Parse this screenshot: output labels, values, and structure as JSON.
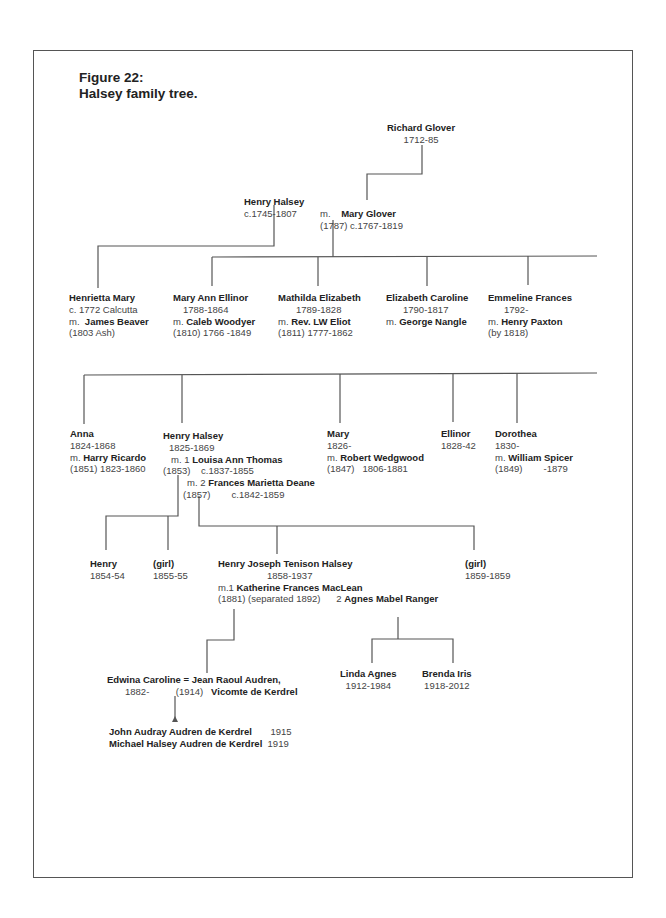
{
  "figure": {
    "label": "Figure 22:",
    "caption": "Halsey family tree."
  },
  "generation_1": {
    "richard_glover": {
      "name": "Richard Glover",
      "dates": "1712-85"
    },
    "henry_halsey": {
      "name": "Henry Halsey",
      "dates": "c.1745-1807"
    },
    "mary_glover": {
      "prefix": "m.",
      "name": "Mary Glover",
      "marriage": "(1787)",
      "dates": "c.1767-1819"
    }
  },
  "generation_2": [
    {
      "name": "Henrietta Mary",
      "line2": "c. 1772 Calcutta",
      "m_prefix": "m.",
      "spouse": "James Beaver",
      "line4": "(1803 Ash)"
    },
    {
      "name": "Mary Ann Ellinor",
      "line2": "1788-1864",
      "m_prefix": "m.",
      "spouse": "Caleb Woodyer",
      "line4": "(1810)  1766 -1849"
    },
    {
      "name": "Mathilda Elizabeth",
      "line2": "1789-1828",
      "m_prefix": "m.",
      "spouse": "Rev. LW Eliot",
      "line4": "(1811)  1777-1862"
    },
    {
      "name": "Elizabeth Caroline",
      "line2": "1790-1817",
      "m_prefix": "m.",
      "spouse": "George Nangle",
      "line4": ""
    },
    {
      "name": "Emmeline Frances",
      "line2": "1792-",
      "m_prefix": "m.",
      "spouse": "Henry Paxton",
      "line4": "(by 1818)"
    }
  ],
  "generation_3": {
    "anna": {
      "name": "Anna",
      "dates": "1824-1868",
      "m_prefix": "m.",
      "spouse": "Harry Ricardo",
      "marriage": "(1851) 1823-1860"
    },
    "henry_halsey": {
      "name": "Henry Halsey",
      "dates": "1825-1869",
      "m1_prefix": "m. 1",
      "spouse1": "Louisa Ann Thomas",
      "m1_marriage": "(1853)",
      "spouse1_dates": "c.1837-1855",
      "m2_prefix": "m. 2",
      "spouse2": "Frances Marietta Deane",
      "m2_marriage": "(1857)",
      "spouse2_dates": "c.1842-1859"
    },
    "mary": {
      "name": "Mary",
      "dates": "1826-",
      "m_prefix": "m.",
      "spouse": "Robert Wedgwood",
      "marriage": "(1847)   1806-1881"
    },
    "ellinor": {
      "name": "Ellinor",
      "dates": "1828-42"
    },
    "dorothea": {
      "name": "Dorothea",
      "dates": "1830-",
      "m_prefix": "m.",
      "spouse": "William Spicer",
      "marriage": "(1849)        -1879"
    }
  },
  "generation_4": {
    "henry": {
      "name": "Henry",
      "dates": "1854-54"
    },
    "girl_1": {
      "name": "(girl)",
      "dates": "1855-55"
    },
    "henry_joseph": {
      "name": "Henry Joseph Tenison Halsey",
      "dates": "1858-1937",
      "m1_prefix": "m.1",
      "spouse1": "Katherine Frances MacLean",
      "m1_detail": "(1881) (separated 1892)",
      "m2_prefix": "2",
      "spouse2": "Agnes Mabel Ranger"
    },
    "girl_2": {
      "name": "(girl)",
      "dates": "1859-1859"
    }
  },
  "generation_5": {
    "edwina": {
      "name": "Edwina Caroline",
      "eq": "=",
      "spouse": "Jean Raoul Audren,",
      "dates": "1882-",
      "marriage": "(1914)",
      "title": "Vicomte de Kerdrel"
    },
    "linda": {
      "name": "Linda Agnes",
      "dates": "1912-1984"
    },
    "brenda": {
      "name": "Brenda Iris",
      "dates": "1918-2012"
    }
  },
  "generation_6": [
    {
      "name": "John Audray Audren de Kerdrel",
      "year": "1915"
    },
    {
      "name": "Michael Halsey Audren de Kerdrel",
      "year": "1919"
    }
  ]
}
